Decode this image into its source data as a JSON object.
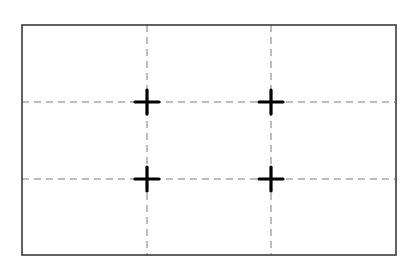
{
  "diagram": {
    "type": "rule-of-thirds-grid",
    "canvas": {
      "width": 416,
      "height": 262,
      "background": "#ffffff"
    },
    "frame": {
      "x": 22,
      "y": 25,
      "width": 374,
      "height": 230,
      "stroke": "#3a3a3a",
      "stroke_width": 1.6
    },
    "grid": {
      "vertical_lines_x": [
        147,
        271
      ],
      "horizontal_lines_y": [
        102,
        179
      ],
      "stroke": "#7a7a7a",
      "stroke_width": 1,
      "dash": "7 5"
    },
    "intersections": {
      "marker": "cross",
      "color": "#000000",
      "arm_length": 12,
      "stroke_width": 3.2,
      "points": [
        {
          "x": 147,
          "y": 102
        },
        {
          "x": 271,
          "y": 102
        },
        {
          "x": 147,
          "y": 179
        },
        {
          "x": 271,
          "y": 179
        }
      ]
    }
  }
}
